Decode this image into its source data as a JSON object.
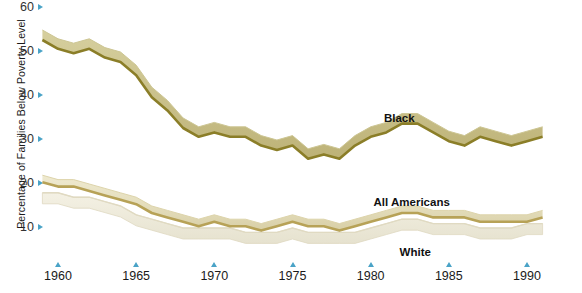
{
  "chart_data": {
    "type": "area",
    "title": "",
    "xlabel": "",
    "ylabel": "Percentage of Families Below Poverty Level",
    "xlim": [
      1959,
      1992
    ],
    "ylim": [
      5,
      60
    ],
    "grid": false,
    "legend_position": "inline-labels",
    "x_ticks": [
      "1960",
      "1965",
      "1970",
      "1975",
      "1980",
      "1985",
      "1990"
    ],
    "y_ticks": [
      "60",
      "50",
      "40",
      "30",
      "20",
      "10"
    ],
    "colors": {
      "black_band_fill": "#c9c08a",
      "black_band_edge": "#8b7e28",
      "all_americans_fill": "#e3dcba",
      "all_americans_edge": "#b9a košt",
      "white_band_fill": "#eeead9",
      "tick_marker": "#4aa3c7",
      "background": "#ffffff"
    },
    "series": [
      {
        "name": "Black",
        "label": "Black",
        "x": [
          1959,
          1960,
          1961,
          1962,
          1963,
          1964,
          1965,
          1966,
          1967,
          1968,
          1969,
          1970,
          1971,
          1972,
          1973,
          1974,
          1975,
          1976,
          1977,
          1978,
          1979,
          1980,
          1981,
          1982,
          1983,
          1984,
          1985,
          1986,
          1987,
          1988,
          1989,
          1990,
          1991
        ],
        "values": [
          55,
          53,
          52,
          53,
          51,
          50,
          47,
          42,
          39,
          35,
          33,
          34,
          33,
          33,
          31,
          30,
          31,
          28,
          29,
          28,
          31,
          33,
          34,
          36,
          36,
          34,
          32,
          31,
          33,
          32,
          31,
          32,
          33
        ]
      },
      {
        "name": "All Americans",
        "label": "All Americans",
        "x": [
          1959,
          1960,
          1961,
          1962,
          1963,
          1964,
          1965,
          1966,
          1967,
          1968,
          1969,
          1970,
          1971,
          1972,
          1973,
          1974,
          1975,
          1976,
          1977,
          1978,
          1979,
          1980,
          1981,
          1982,
          1983,
          1984,
          1985,
          1986,
          1987,
          1988,
          1989,
          1990,
          1991
        ],
        "values": [
          22,
          21,
          21,
          20,
          19,
          18,
          17,
          15,
          14,
          13,
          12,
          13,
          12,
          12,
          11,
          12,
          13,
          12,
          12,
          11,
          12,
          13,
          14,
          15,
          15,
          14,
          14,
          14,
          13,
          13,
          13,
          13,
          14
        ]
      },
      {
        "name": "White",
        "label": "White",
        "x": [
          1959,
          1960,
          1961,
          1962,
          1963,
          1964,
          1965,
          1966,
          1967,
          1968,
          1969,
          1970,
          1971,
          1972,
          1973,
          1974,
          1975,
          1976,
          1977,
          1978,
          1979,
          1980,
          1981,
          1982,
          1983,
          1984,
          1985,
          1986,
          1987,
          1988,
          1989,
          1990,
          1991
        ],
        "values": [
          18,
          18,
          17,
          17,
          16,
          15,
          13,
          12,
          11,
          10,
          10,
          10,
          10,
          9,
          9,
          9,
          10,
          9,
          9,
          9,
          9,
          10,
          11,
          12,
          12,
          11,
          11,
          11,
          10,
          10,
          10,
          11,
          11
        ]
      }
    ],
    "annotations": [
      {
        "text": "Black",
        "x": 1982,
        "y": 35
      },
      {
        "text": "All Americans",
        "x": 1983,
        "y": 16
      },
      {
        "text": "White",
        "x": 1983,
        "y": 9
      }
    ]
  }
}
